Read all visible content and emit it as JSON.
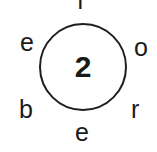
{
  "puzzle": {
    "center_number": "2",
    "letters": {
      "top": "f",
      "top_right": "o",
      "bottom_right": "r",
      "bottom": "e",
      "bottom_left": "b",
      "top_left": "e"
    }
  }
}
